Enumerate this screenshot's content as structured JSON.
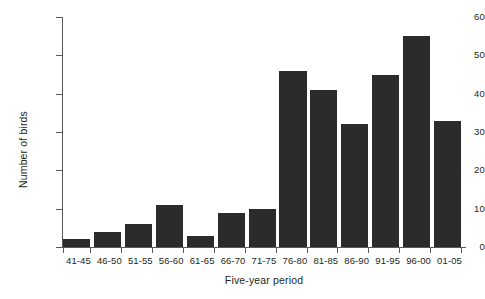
{
  "chart_data": {
    "type": "bar",
    "title": "",
    "subtitle": "",
    "xlabel": "Five-year period",
    "ylabel": "Number of birds",
    "categories": [
      "41-45",
      "46-50",
      "51-55",
      "56-60",
      "61-65",
      "66-70",
      "71-75",
      "76-80",
      "81-85",
      "86-90",
      "91-95",
      "96-00",
      "01-05"
    ],
    "values": [
      2,
      4,
      6,
      11,
      3,
      9,
      10,
      46,
      41,
      32,
      45,
      55,
      33
    ],
    "ylim": [
      0,
      60
    ],
    "xlim_categorical": true,
    "y_ticks": [
      0,
      10,
      20,
      30,
      40,
      50,
      60
    ],
    "y_tick_labels": [
      "0",
      "10",
      "20",
      "30",
      "40",
      "50",
      "60"
    ],
    "grid": false,
    "legend": null,
    "legend_position": "none",
    "annotations": [],
    "bar_color": "#2b2b2b",
    "axis_color": "#58595b",
    "background_color": "#ffffff",
    "text_color": "#231f20"
  }
}
